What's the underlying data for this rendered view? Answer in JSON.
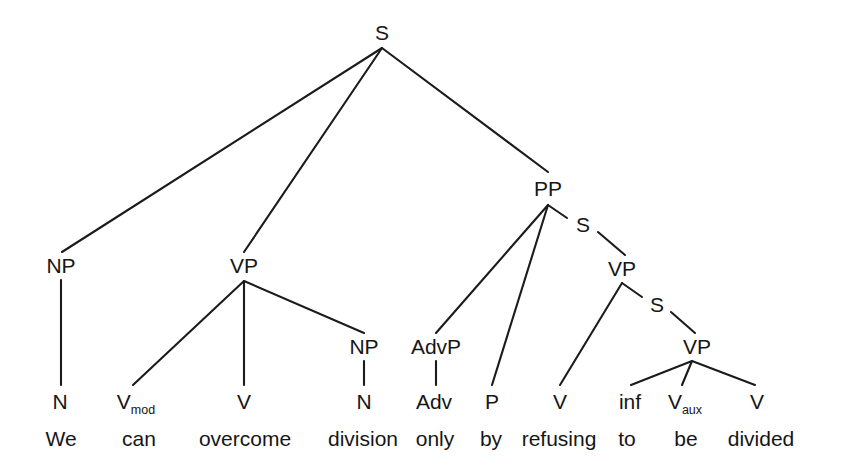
{
  "figure": {
    "type": "constituency-syntax-tree",
    "sentence": "We can overcome division only by refusing to be divided",
    "background_color": "#ffffff",
    "line_color": "#1b1b1b"
  },
  "nodes": {
    "root_s": "S",
    "np_subject": "NP",
    "vp_main": "VP",
    "pp": "PP",
    "s_embedded_1": "S",
    "vp_embedded_1": "VP",
    "s_embedded_2": "S",
    "vp_embedded_2": "VP",
    "np_object": "NP",
    "advp": "AdvP"
  },
  "pos_tags": [
    {
      "id": "pos-n-we",
      "label": "N",
      "sub": "",
      "x": 60
    },
    {
      "id": "pos-vmod-can",
      "label": "V",
      "sub": "mod",
      "x": 136
    },
    {
      "id": "pos-v-overcome",
      "label": "V",
      "sub": "",
      "x": 244
    },
    {
      "id": "pos-n-division",
      "label": "N",
      "sub": "",
      "x": 364
    },
    {
      "id": "pos-adv-only",
      "label": "Adv",
      "sub": "",
      "x": 434
    },
    {
      "id": "pos-p-by",
      "label": "P",
      "sub": "",
      "x": 492
    },
    {
      "id": "pos-v-refusing",
      "label": "V",
      "sub": "",
      "x": 560
    },
    {
      "id": "pos-inf-to",
      "label": "inf",
      "sub": "",
      "x": 630
    },
    {
      "id": "pos-vaux-be",
      "label": "V",
      "sub": "aux",
      "x": 685
    },
    {
      "id": "pos-v-divided",
      "label": "V",
      "sub": "",
      "x": 757
    }
  ],
  "terminals": [
    {
      "id": "word-we",
      "text": "We",
      "x": 61
    },
    {
      "id": "word-can",
      "text": "can",
      "x": 139
    },
    {
      "id": "word-overcome",
      "text": "overcome",
      "x": 245
    },
    {
      "id": "word-division",
      "text": "division",
      "x": 363
    },
    {
      "id": "word-only",
      "text": "only",
      "x": 435
    },
    {
      "id": "word-by",
      "text": "by",
      "x": 491
    },
    {
      "id": "word-refusing",
      "text": "refusing",
      "x": 559
    },
    {
      "id": "word-to",
      "text": "to",
      "x": 627
    },
    {
      "id": "word-be",
      "text": "be",
      "x": 686
    },
    {
      "id": "word-divided",
      "text": "divided",
      "x": 761
    }
  ]
}
